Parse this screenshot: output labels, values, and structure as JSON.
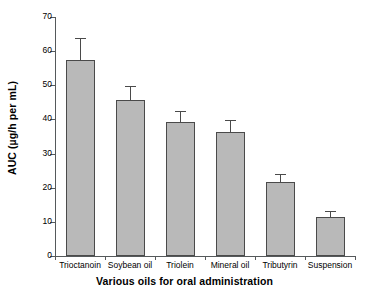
{
  "chart_data": {
    "type": "bar",
    "title": "",
    "xlabel": "Various oils for oral administration",
    "ylabel": "AUC (µg/h per mL)",
    "categories": [
      "Trioctanoin",
      "Soybean oil",
      "Triolein",
      "Mineral oil",
      "Tributyrin",
      "Suspension"
    ],
    "values": [
      57.5,
      45.7,
      39.2,
      36.2,
      21.6,
      11.3
    ],
    "errors": [
      6.0,
      3.8,
      3.1,
      3.3,
      2.2,
      1.5
    ],
    "error_type": "upper-only",
    "ylim": [
      0,
      70
    ],
    "yticks": [
      0,
      10,
      20,
      30,
      40,
      50,
      60,
      70
    ],
    "ytick_labels": [
      "0",
      "10",
      "20",
      "30",
      "40",
      "50",
      "60",
      "70"
    ],
    "grid": false,
    "legend": null,
    "bar_color": "#b9b9b9",
    "bar_edge_color": "#4a4a4a",
    "axis_color": "#55595b"
  }
}
